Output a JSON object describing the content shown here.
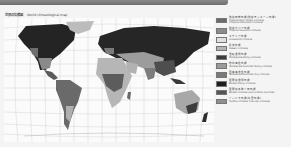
{
  "header": {
    "title_jp": "世界の気候図",
    "title_en": "World climatological map"
  },
  "map": {
    "projection": "interrupted-world-grid",
    "colors": {
      "ocean": "#fbfbfb",
      "grid": "#bdbdbd",
      "land_light": "#b8b8b8",
      "land_mid": "#8a8a8a",
      "land_dark": "#2a2a2a",
      "ice": "#d6d6d6"
    }
  },
  "legend": {
    "items": [
      {
        "jp": "熱帯雨林気候(熱帯モンスーン気候)",
        "en": "Tropical Rain Forest Climate",
        "en2": "(Tropical Monsoon Climate)",
        "color": "#6a6a6a"
      },
      {
        "jp": "熱帯サバナ気候",
        "en": "Tropical Savanna Climate",
        "color": "#8c8c8c"
      },
      {
        "jp": "ステップ気候",
        "en": "Grassland Climate",
        "color": "#e0e0e0"
      },
      {
        "jp": "砂漠気候",
        "en": "Desert Climate",
        "color": "#b4b4b4"
      },
      {
        "jp": "温暖湿潤気候",
        "en": "Temperate Rainy Climate",
        "color": "#3a3a3a"
      },
      {
        "jp": "地中海性気候",
        "en": "Temperate Summer Rainy Climate",
        "color": "#9a9a9a"
      },
      {
        "jp": "西岸海洋性気候",
        "en": "Temperate Summer Dry Climate",
        "color": "#7a7a7a"
      },
      {
        "jp": "亜寒帯湿潤気候",
        "en": "Boreal Rainy Climate",
        "color": "#1e1e1e"
      },
      {
        "jp": "亜寒帯冬季少雨気候",
        "en": "Boreal Climate with a Moist Summer",
        "color": "#555555"
      },
      {
        "jp": "ツンドラ気候(氷雪気候)",
        "en": "Tundra Climate (Ice-cap Climate)",
        "color": "#8f8f8f"
      }
    ]
  }
}
